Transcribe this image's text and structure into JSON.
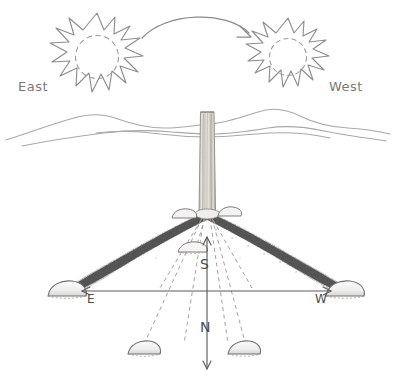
{
  "figure": {
    "background_color": "#ffffff",
    "ink_color": "#6b6b6b",
    "shadow_color": "#4a4a4a",
    "width": 395,
    "height": 388
  },
  "sky": {
    "sun_east": {
      "label": "East",
      "icon": "sun-icon",
      "center_x": 97,
      "center_y": 58,
      "outer_radius": 46,
      "inner_radius": 21,
      "points": 13
    },
    "sun_west": {
      "label": "West",
      "icon": "sun-icon",
      "center_x": 288,
      "center_y": 58,
      "outer_radius": 40,
      "inner_radius": 18,
      "points": 13
    },
    "motion_arrow": {
      "icon": "arc-arrow-icon",
      "from_x": 142,
      "from_y": 38,
      "to_x": 250,
      "to_y": 38,
      "peak_y": 14,
      "direction": "east-to-west"
    }
  },
  "horizon": {
    "icon": "mountain-range-icon",
    "baseline_y": 133
  },
  "gnomon": {
    "icon": "wooden-post-icon",
    "top_y": 112,
    "base_y": 214,
    "center_x": 207,
    "width": 14
  },
  "shadows": [
    {
      "name": "morning-shadow",
      "label": "",
      "direction": "west-southwest",
      "tip_x": 68,
      "tip_y": 290,
      "solid": true
    },
    {
      "name": "afternoon-shadow",
      "direction": "east-southeast",
      "tip_x": 344,
      "tip_y": 290,
      "solid": true
    }
  ],
  "markers": [
    {
      "name": "stone-east-end",
      "icon": "stone-icon",
      "x": 66,
      "y": 291,
      "w": 36,
      "h": 17
    },
    {
      "name": "stone-west-end",
      "icon": "stone-icon",
      "x": 345,
      "y": 291,
      "w": 36,
      "h": 17
    },
    {
      "name": "stone-near-base-left",
      "icon": "stone-icon",
      "x": 183,
      "y": 215,
      "w": 24,
      "h": 11
    },
    {
      "name": "stone-near-base-right",
      "icon": "stone-icon",
      "x": 222,
      "y": 213,
      "w": 22,
      "h": 10
    },
    {
      "name": "stone-midday",
      "icon": "stone-icon",
      "x": 192,
      "y": 247,
      "w": 26,
      "h": 12
    },
    {
      "name": "stone-south-left",
      "icon": "stone-icon",
      "x": 143,
      "y": 348,
      "w": 30,
      "h": 15
    },
    {
      "name": "stone-south-right",
      "icon": "stone-icon",
      "x": 243,
      "y": 348,
      "w": 30,
      "h": 15
    }
  ],
  "compass": {
    "east": {
      "label": "E",
      "label_x": 92,
      "label_y": 299,
      "arrow_tip_x": 82,
      "arrow_tip_y": 291
    },
    "west": {
      "label": "W",
      "label_x": 320,
      "label_y": 299,
      "arrow_tip_x": 330,
      "arrow_tip_y": 291
    },
    "south": {
      "label": "S",
      "label_x": 203,
      "label_y": 266,
      "arrow_tip_x": 207,
      "arrow_tip_y": 236
    },
    "north": {
      "label": "N",
      "label_x": 203,
      "label_y": 329,
      "arrow_tip_x": 207,
      "arrow_tip_y": 370
    },
    "axis_horizontal_y": 291,
    "axis_vertical_x": 207
  },
  "ray_lines": {
    "style": "dashed",
    "origin_x": 207,
    "origin_y": 216,
    "targets": [
      {
        "name": "ray-to-stone-midday",
        "x": 196,
        "y": 250
      },
      {
        "name": "ray-to-stone-south-left",
        "x": 144,
        "y": 344
      },
      {
        "name": "ray-to-stone-south-right",
        "x": 244,
        "y": 344
      },
      {
        "name": "ray-inner-left",
        "x": 182,
        "y": 344
      },
      {
        "name": "ray-inner-right",
        "x": 226,
        "y": 344
      }
    ]
  }
}
